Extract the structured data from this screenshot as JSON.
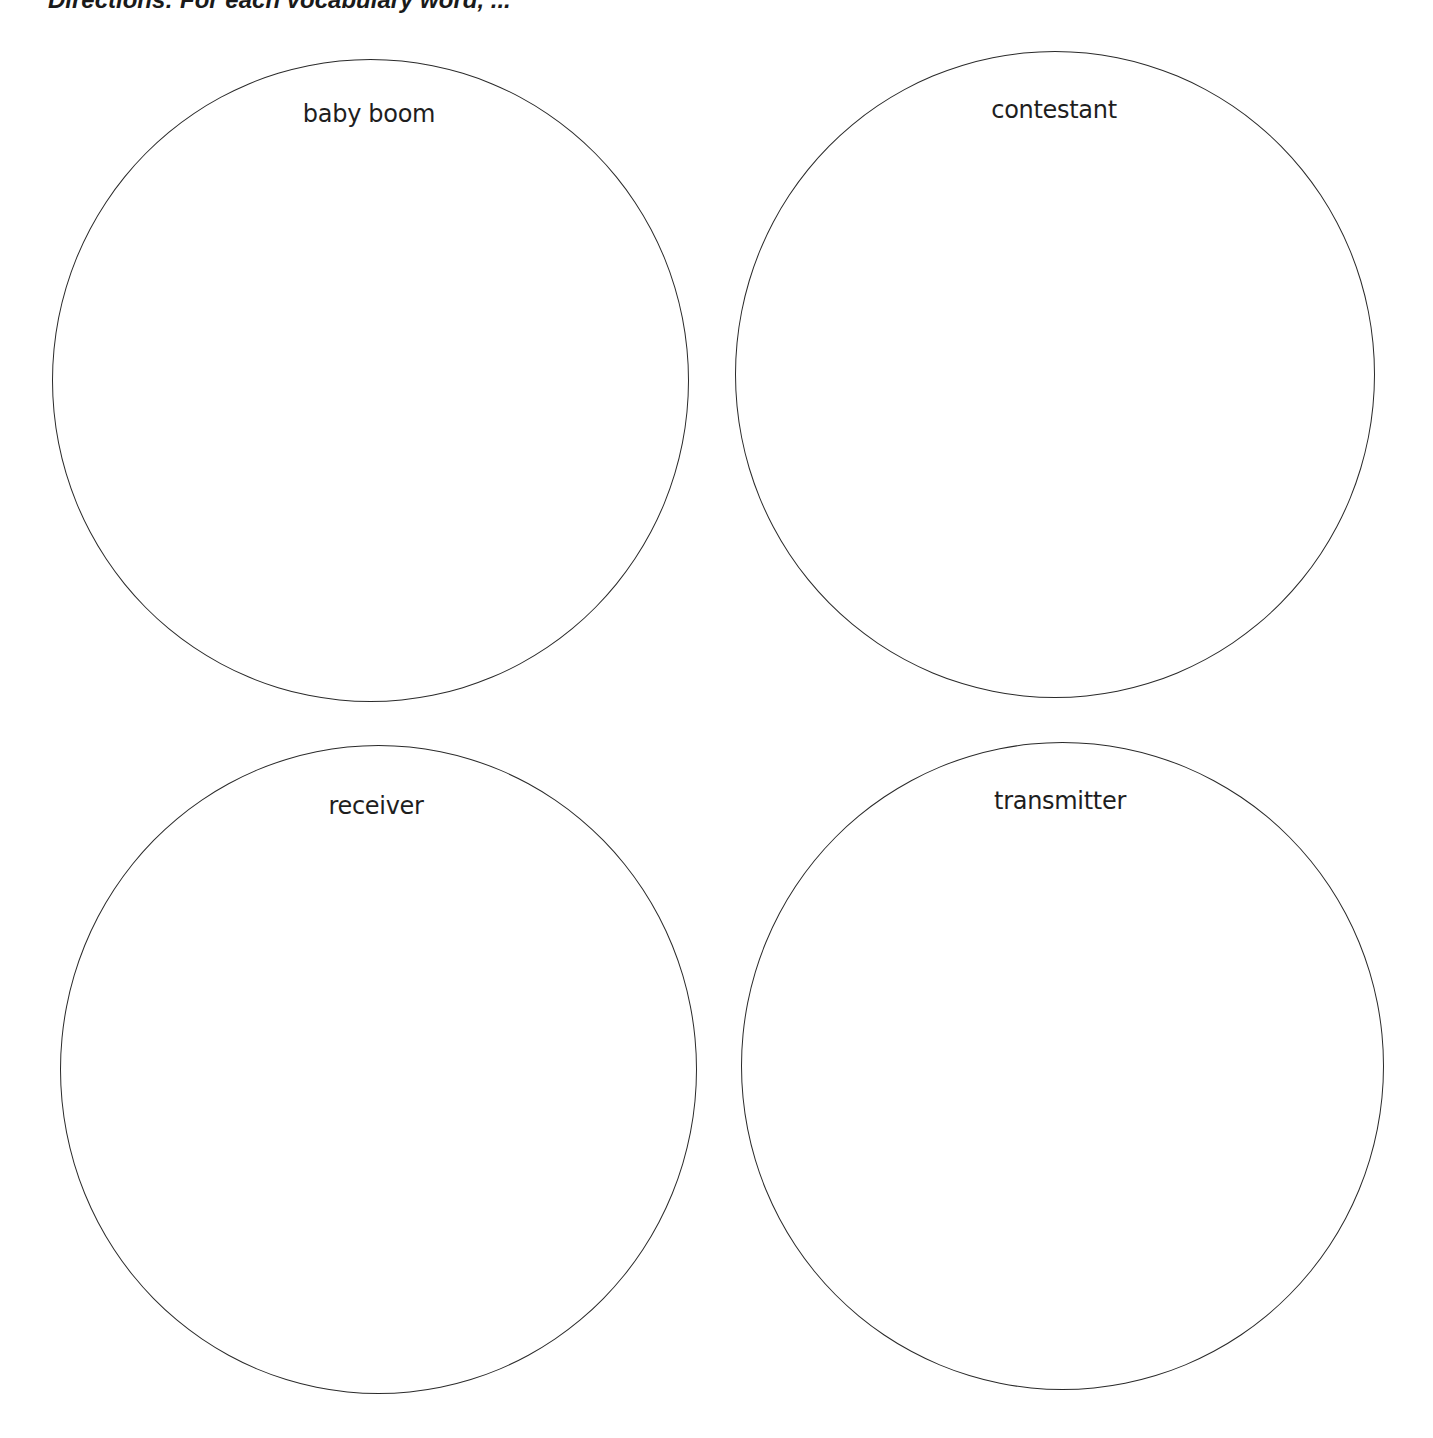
{
  "header": {
    "directions_text": "Directions: For each vocabulary word, ..."
  },
  "circles": [
    {
      "label": "baby boom"
    },
    {
      "label": "contestant"
    },
    {
      "label": "receiver"
    },
    {
      "label": "transmitter"
    }
  ],
  "colors": {
    "stroke": "#2a2a2a",
    "text": "#1e1e1e",
    "background": "#ffffff"
  }
}
